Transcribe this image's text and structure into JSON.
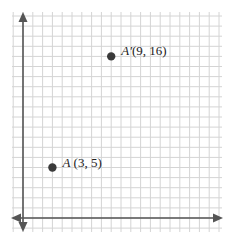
{
  "diagram": {
    "type": "coordinate-plane",
    "grid": {
      "unit_px_x": 9.8,
      "unit_px_y": 10.1,
      "origin_px": [
        23,
        218
      ],
      "x_range": [
        -1,
        20
      ],
      "y_range": [
        -1,
        20
      ]
    },
    "colors": {
      "grid": "#d4d4d4",
      "axis": "#555555",
      "point": "#3a3a3a"
    },
    "points": [
      {
        "name": "A",
        "x": 3,
        "y": 5,
        "label": "A (3, 5)"
      },
      {
        "name": "A'",
        "x": 9,
        "y": 16,
        "label": "A′(9, 16)"
      }
    ]
  }
}
